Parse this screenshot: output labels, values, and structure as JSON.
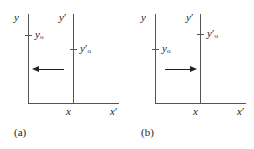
{
  "figure": {
    "background": "#ffffff",
    "line_color": "#555555",
    "arrow_color": "#222222"
  },
  "panels": [
    {
      "caption": "(a)",
      "frames": [
        {
          "vertical_axis_label": "y",
          "horizontal_axis_label": "x",
          "tick_label_base": "y",
          "tick_label_sub": "o",
          "tick_label_prime": "",
          "tick_y_px": 35
        },
        {
          "vertical_axis_label": "y",
          "vertical_axis_prime": "′",
          "horizontal_axis_label": "x",
          "horizontal_axis_prime": "′",
          "tick_label_base": "y",
          "tick_label_sub": "o",
          "tick_label_prime": "′",
          "tick_y_px": 49
        }
      ],
      "arrow": {
        "direction": "left",
        "y_px": 69
      }
    },
    {
      "caption": "(b)",
      "frames": [
        {
          "vertical_axis_label": "y",
          "horizontal_axis_label": "x",
          "tick_label_base": "y",
          "tick_label_sub": "o",
          "tick_label_prime": "",
          "tick_y_px": 49
        },
        {
          "vertical_axis_label": "y",
          "vertical_axis_prime": "′",
          "horizontal_axis_label": "x",
          "horizontal_axis_prime": "′",
          "tick_label_base": "y",
          "tick_label_sub": "o",
          "tick_label_prime": "′",
          "tick_y_px": 34
        }
      ],
      "arrow": {
        "direction": "right",
        "y_px": 69
      }
    }
  ]
}
